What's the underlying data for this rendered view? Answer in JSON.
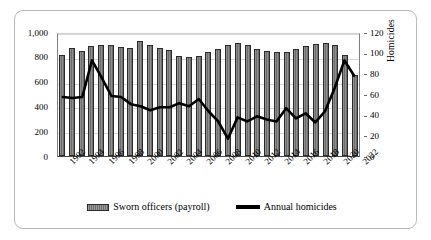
{
  "chart_data": {
    "type": "bar",
    "title": "",
    "subtitle": "",
    "xlabel": "",
    "ylabel": "",
    "ylabel_right": "Homicides",
    "grid": true,
    "legend_position": "bottom",
    "ylim": [
      0,
      1000
    ],
    "ylim_right": [
      0,
      120
    ],
    "yticks": [
      "0",
      "200",
      "400",
      "600",
      "800",
      "1,000"
    ],
    "ytick_values": [
      0,
      200,
      400,
      600,
      800,
      1000
    ],
    "yticks_right": [
      "0",
      "20",
      "40",
      "60",
      "80",
      "100",
      "120"
    ],
    "ytick_values_right": [
      0,
      20,
      40,
      60,
      80,
      100,
      120
    ],
    "categories": [
      1992,
      1993,
      1994,
      1995,
      1996,
      1997,
      1998,
      1999,
      2000,
      2001,
      2002,
      2003,
      2004,
      2005,
      2006,
      2007,
      2008,
      2009,
      2010,
      2011,
      2012,
      2013,
      2014,
      2015,
      2016,
      2017,
      2018,
      2019,
      2020,
      2021,
      2022
    ],
    "xtick_labels": [
      "1992",
      "1994",
      "1996",
      "1998",
      "2000",
      "2002",
      "2004",
      "2006",
      "2008",
      "2010",
      "2012",
      "2014",
      "2016",
      "2018",
      "2020",
      "2022"
    ],
    "series": [
      {
        "name": "Sworn officers (payroll)",
        "type": "bar",
        "axis": "left",
        "values": [
          812,
          875,
          847,
          888,
          899,
          893,
          878,
          872,
          925,
          897,
          869,
          858,
          810,
          798,
          808,
          840,
          862,
          899,
          912,
          893,
          866,
          849,
          842,
          841,
          861,
          890,
          904,
          912,
          893,
          814,
          652
        ]
      },
      {
        "name": "Annual homicides",
        "type": "line",
        "axis": "right",
        "values": [
          58,
          57,
          58,
          94,
          77,
          59,
          58,
          51,
          49,
          45,
          48,
          48,
          52,
          49,
          56,
          44,
          34,
          17,
          38,
          34,
          39,
          36,
          34,
          47,
          37,
          42,
          33,
          44,
          67,
          94,
          79
        ]
      }
    ]
  },
  "legend": {
    "items": [
      {
        "label": "Sworn officers (payroll)",
        "marker": "bar-swatch",
        "color": "#6d6d6d"
      },
      {
        "label": "Annual homicides",
        "marker": "line-swatch",
        "color": "#000000"
      }
    ]
  },
  "colors": {
    "bar_fill": "#6d6d6d",
    "bar_edge": "#2b2b2b",
    "line": "#000000",
    "grid": "#d8d8d8",
    "axis": "#4a4a4a",
    "frame": "#b9b9b9",
    "background": "#ffffff"
  }
}
